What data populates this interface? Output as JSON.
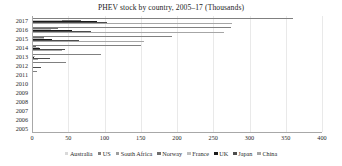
{
  "chart_data": {
    "type": "bar",
    "orientation": "horizontal",
    "title": "PHEV stock by country, 2005–17 (Thousands)",
    "xlabel": "",
    "ylabel": "",
    "xlim": [
      0,
      400
    ],
    "xticks": [
      0,
      50,
      100,
      150,
      200,
      250,
      300,
      350,
      400
    ],
    "grid": true,
    "legend_position": "bottom",
    "categories": [
      "2017",
      "2016",
      "2015",
      "2014",
      "2013",
      "2012",
      "2011",
      "2010",
      "2009",
      "2008",
      "2007",
      "2006",
      "2005"
    ],
    "series": [
      {
        "name": "Australia",
        "color": "#d9d9d9",
        "values": [
          1.2,
          0.9,
          0.6,
          0.4,
          0.2,
          0.1,
          0.0,
          0.0,
          0.0,
          0.0,
          0.0,
          0.0,
          0.0
        ]
      },
      {
        "name": "US",
        "color": "#808080",
        "values": [
          360.0,
          275.0,
          193.0,
          150.0,
          95.0,
          47.0,
          7.5,
          0.4,
          0.0,
          0.0,
          0.0,
          0.0,
          0.0
        ]
      },
      {
        "name": "South Africa",
        "color": "#9e9e9e",
        "values": [
          0.3,
          0.2,
          0.1,
          0.05,
          0.0,
          0.0,
          0.0,
          0.0,
          0.0,
          0.0,
          0.0,
          0.0,
          0.0
        ]
      },
      {
        "name": "Norway",
        "color": "#6e6e6e",
        "values": [
          68.0,
          36.0,
          17.0,
          6.0,
          1.3,
          0.4,
          0.1,
          0.0,
          0.0,
          0.0,
          0.0,
          0.0,
          0.0
        ]
      },
      {
        "name": "France",
        "color": "#bfbfbf",
        "values": [
          42.0,
          26.0,
          16.0,
          9.5,
          4.5,
          1.3,
          0.2,
          0.0,
          0.0,
          0.0,
          0.0,
          0.0,
          0.0
        ]
      },
      {
        "name": "UK",
        "color": "#1a1a1a",
        "values": [
          90.0,
          55.0,
          28.0,
          11.0,
          2.5,
          0.7,
          0.2,
          0.0,
          0.0,
          0.0,
          0.0,
          0.0,
          0.0
        ]
      },
      {
        "name": "Japan",
        "color": "#4d4d4d",
        "values": [
          103.0,
          82.0,
          65.0,
          45.0,
          25.0,
          12.0,
          1.0,
          0.0,
          0.0,
          0.0,
          0.0,
          0.0,
          0.0
        ]
      },
      {
        "name": "China",
        "color": "#a6a6a6",
        "values": [
          276.0,
          265.0,
          155.0,
          42.0,
          8.0,
          2.0,
          0.3,
          0.0,
          0.0,
          0.0,
          0.0,
          0.0,
          0.0
        ]
      }
    ]
  }
}
